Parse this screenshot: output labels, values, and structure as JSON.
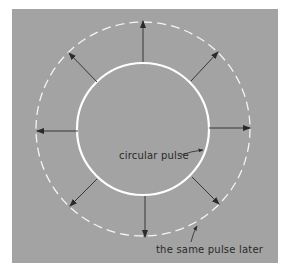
{
  "figure": {
    "background_color": "#a3a3a3",
    "circle_color": "#ffffff",
    "arrow_color": "#2a2a2a",
    "center": [
      143,
      129
    ],
    "inner_radius": 66,
    "outer_radius": 107,
    "arrow_count": 8
  },
  "labels": {
    "inner": "circular pulse",
    "outer": "the same pulse later"
  }
}
